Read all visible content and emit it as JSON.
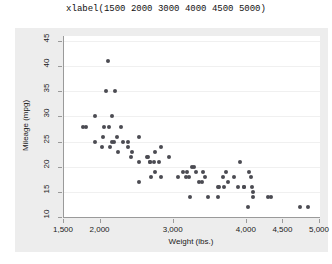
{
  "caption": "xlabel(1500 2000 3000 4000 4500 5000)",
  "colors": {
    "marker": "#4b4b52",
    "graph_region_background": "#ededed",
    "plot_background": "#ffffff",
    "axis_line": "#9a9a9a",
    "gridline": "#f0f0f0",
    "text": "#1a1a1a"
  },
  "chart_data": {
    "type": "scatter",
    "title": "xlabel(1500 2000 3000 4000 4500 5000)",
    "xlabel": "Weight (lbs.)",
    "ylabel": "Mileage (mpg)",
    "xlim": [
      1500,
      5000
    ],
    "ylim": [
      10,
      46
    ],
    "grid": "horizontal",
    "legend": "none",
    "xticks": [
      1500,
      2000,
      3000,
      4000,
      4500,
      5000
    ],
    "xtick_labels": [
      "1,500",
      "2,000",
      "3,000",
      "4,000",
      "4,500",
      "5,000"
    ],
    "yticks": [
      10,
      15,
      20,
      25,
      30,
      35,
      40,
      45
    ],
    "ytick_labels": [
      "10",
      "15",
      "20",
      "25",
      "30",
      "35",
      "40",
      "45"
    ],
    "series": [
      {
        "name": "auto",
        "points": [
          [
            2930,
            22
          ],
          [
            3350,
            17
          ],
          [
            2640,
            22
          ],
          [
            3250,
            20
          ],
          [
            4080,
            15
          ],
          [
            3670,
            18
          ],
          [
            2230,
            26
          ],
          [
            3280,
            20
          ],
          [
            3880,
            16
          ],
          [
            3400,
            19
          ],
          [
            3310,
            19
          ],
          [
            3060,
            18
          ],
          [
            3740,
            17
          ],
          [
            2750,
            19
          ],
          [
            3470,
            14
          ],
          [
            3600,
            14
          ],
          [
            4330,
            14
          ],
          [
            3900,
            21
          ],
          [
            4290,
            14
          ],
          [
            4080,
            14
          ],
          [
            3180,
            19
          ],
          [
            3220,
            14
          ],
          [
            4030,
            19
          ],
          [
            3130,
            19
          ],
          [
            4060,
            18
          ],
          [
            3720,
            19
          ],
          [
            3955,
            16
          ],
          [
            2730,
            21
          ],
          [
            3955,
            16
          ],
          [
            3830,
            18
          ],
          [
            4010,
            12
          ],
          [
            3690,
            16
          ],
          [
            2830,
            18
          ],
          [
            2300,
            25
          ],
          [
            3170,
            18
          ],
          [
            3430,
            18
          ],
          [
            3380,
            17
          ],
          [
            4070,
            16
          ],
          [
            3620,
            16
          ],
          [
            2650,
            22
          ],
          [
            3600,
            16
          ],
          [
            4720,
            12
          ],
          [
            4840,
            12
          ],
          [
            3210,
            18
          ],
          [
            2020,
            24
          ],
          [
            2160,
            25
          ],
          [
            2670,
            21
          ],
          [
            2750,
            23
          ],
          [
            2120,
            28
          ],
          [
            2430,
            23
          ],
          [
            2130,
            24
          ],
          [
            2800,
            21
          ],
          [
            2050,
            28
          ],
          [
            2410,
            22
          ],
          [
            2520,
            21
          ],
          [
            2690,
            18
          ],
          [
            2370,
            24
          ],
          [
            2280,
            28
          ],
          [
            2200,
            35
          ],
          [
            1930,
            30
          ],
          [
            2100,
            41
          ],
          [
            1800,
            28
          ],
          [
            1760,
            28
          ],
          [
            2670,
            21
          ],
          [
            2370,
            25
          ],
          [
            2830,
            24
          ],
          [
            2070,
            35
          ],
          [
            2160,
            30
          ],
          [
            2040,
            26
          ],
          [
            1930,
            25
          ],
          [
            2520,
            26
          ],
          [
            2190,
            25
          ],
          [
            2240,
            23
          ],
          [
            2520,
            17
          ]
        ]
      }
    ]
  }
}
